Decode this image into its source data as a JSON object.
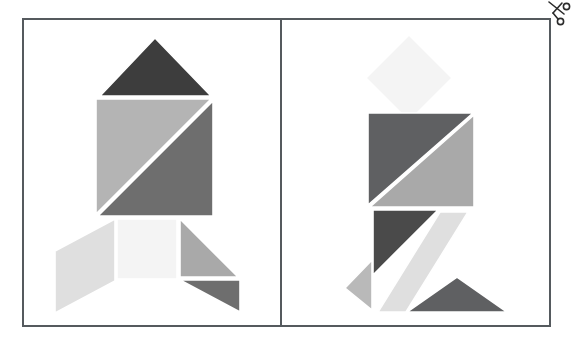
{
  "page": {
    "width": 575,
    "height": 338,
    "background": "#ffffff"
  },
  "frame": {
    "name": "worksheet-border",
    "border_color": "#555a5e",
    "border_width": 2,
    "divider_color": "#555a5e",
    "divider_x": 280
  },
  "icons": [
    {
      "name": "scissors-icon",
      "label": "scissors",
      "color": "#2b2b2b",
      "x": 546,
      "y": 1
    }
  ],
  "palette": {
    "near_white": "#f4f4f4",
    "light_gray": "#dadada",
    "mid_light_gray": "#c2c2c2",
    "mid_gray": "#a9a9a9",
    "gray": "#9a9a9a",
    "dark_gray": "#6e6e6e",
    "darker_gray": "#5f6062",
    "charcoal": "#3d3d3d"
  },
  "figures": [
    {
      "name": "rocket-figure",
      "label": "Rocket",
      "panel": "left",
      "piece_count": 7,
      "pieces": [
        {
          "name": "nose-cone-triangle",
          "shape": "triangle",
          "fill": "#3d3d3d",
          "points": "100,96 155,38 211,96"
        },
        {
          "name": "body-upper-left-triangle",
          "shape": "triangle",
          "fill": "#b4b4b4",
          "points": "96,99 211,99 96,214"
        },
        {
          "name": "body-lower-right-triangle",
          "shape": "triangle",
          "fill": "#6e6e6e",
          "points": "213,101 213,216 98,216"
        },
        {
          "name": "exhaust-square",
          "shape": "square",
          "fill": "#f4f4f4",
          "points": "117,219 177,219 177,279 117,279"
        },
        {
          "name": "left-fin-parallelogram",
          "shape": "parallelogram",
          "fill": "#dfdfdf",
          "points": "115,219 115,281 55,313 55,251"
        },
        {
          "name": "right-fin-upper-triangle",
          "shape": "triangle",
          "fill": "#a9a9a9",
          "points": "180,219 238,277 180,277"
        },
        {
          "name": "right-fin-lower-triangle",
          "shape": "triangle",
          "fill": "#6e6e6e",
          "points": "180,280 240,280 240,312"
        }
      ]
    },
    {
      "name": "person-figure",
      "label": "Walking person",
      "panel": "right",
      "piece_count": 7,
      "pieces": [
        {
          "name": "head-diamond-square",
          "shape": "square-rotated",
          "fill": "#f4f4f4",
          "points": "409,35 452,78 409,121 366,78"
        },
        {
          "name": "torso-upper-left-triangle",
          "shape": "triangle",
          "fill": "#5f6062",
          "points": "368,113 473,113 368,205"
        },
        {
          "name": "torso-lower-right-triangle",
          "shape": "triangle",
          "fill": "#a9a9a9",
          "points": "474,115 474,207 370,207"
        },
        {
          "name": "upper-leg-dark-triangle",
          "shape": "triangle",
          "fill": "#4a4a4a",
          "points": "373,210 438,210 373,275"
        },
        {
          "name": "lower-leg-parallelogram",
          "shape": "parallelogram",
          "fill": "#dfdfdf",
          "points": "440,212 468,212 406,312 378,312"
        },
        {
          "name": "left-foot-triangle",
          "shape": "triangle",
          "fill": "#b9b9b9",
          "points": "372,260 372,310 345,288"
        },
        {
          "name": "right-foot-triangle",
          "shape": "triangle",
          "fill": "#5f6062",
          "points": "457,277 507,312 407,312"
        }
      ]
    }
  ]
}
